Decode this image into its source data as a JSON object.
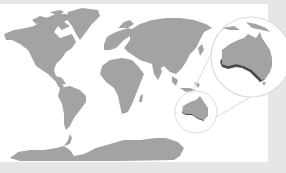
{
  "map": {
    "type": "world-map-highlight",
    "regions": [
      "north-america",
      "greenland",
      "south-america",
      "europe",
      "africa",
      "asia",
      "australia",
      "antarctica"
    ],
    "highlighted_region": "australia",
    "highlight_detail": "southern coastline",
    "inset": {
      "shape": "circle",
      "subject": "australia-zoom"
    },
    "colors": {
      "land": "#a3a3a3",
      "ocean": "#ffffff",
      "frame": "#e6e6e6",
      "highlight": "#4a4a4a",
      "circle_stroke": "#dcdcdc"
    }
  }
}
